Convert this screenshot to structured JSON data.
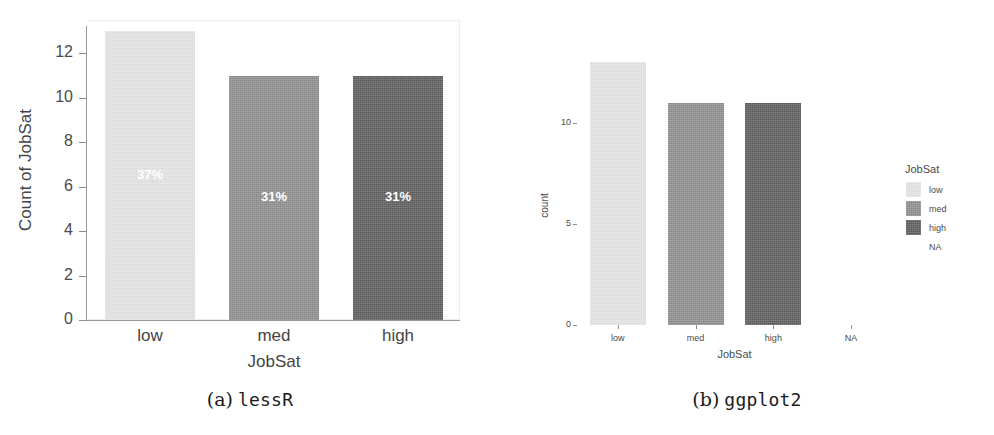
{
  "figure": {
    "subfigures": [
      {
        "label": "(a)",
        "name": "lessR"
      },
      {
        "label": "(b)",
        "name": "ggplot2"
      }
    ]
  },
  "colors": {
    "low": "#e2e2e2",
    "med": "#8a8a8a",
    "high": "#595959",
    "axis": "#8e8e8e",
    "text": "#454545",
    "panel_border": "#ececec"
  },
  "chart_data": [
    {
      "type": "bar",
      "id": "lessR",
      "title": "",
      "xlabel": "JobSat",
      "ylabel": "Count of JobSat",
      "categories": [
        "low",
        "med",
        "high"
      ],
      "values": [
        13,
        11,
        11
      ],
      "data_labels": [
        "37%",
        "31%",
        "31%"
      ],
      "bar_colors": [
        "#e2e2e2",
        "#8a8a8a",
        "#595959"
      ],
      "ylim": [
        0,
        13.5
      ],
      "yticks": [
        0,
        2,
        4,
        6,
        8,
        10,
        12
      ],
      "ytick_labels": [
        "0",
        "2",
        "4",
        "6",
        "8",
        "10",
        "12"
      ],
      "grid": false,
      "legend": false
    },
    {
      "type": "bar",
      "id": "ggplot2",
      "title": "",
      "xlabel": "JobSat",
      "ylabel": "count",
      "categories": [
        "low",
        "med",
        "high",
        "NA"
      ],
      "values": [
        13,
        11,
        11,
        0
      ],
      "bar_colors": [
        "#e2e2e2",
        "#8a8a8a",
        "#595959",
        "#ffffff"
      ],
      "ylim": [
        0,
        13.5
      ],
      "yticks": [
        0,
        5,
        10
      ],
      "ytick_labels": [
        "0",
        "5",
        "10"
      ],
      "grid": false,
      "legend": {
        "position": "right",
        "title": "JobSat",
        "entries": [
          {
            "label": "low",
            "color": "#e2e2e2",
            "swatch": true
          },
          {
            "label": "med",
            "color": "#8a8a8a",
            "swatch": true
          },
          {
            "label": "high",
            "color": "#595959",
            "swatch": true
          },
          {
            "label": "NA",
            "color": "#ffffff",
            "swatch": false
          }
        ]
      }
    }
  ]
}
